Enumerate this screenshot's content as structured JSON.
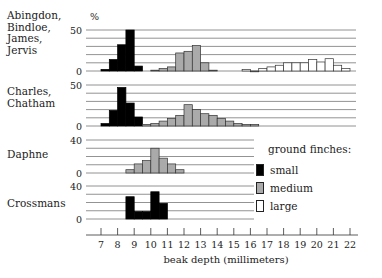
{
  "chart_data": {
    "type": "bar",
    "subtype": "stacked-panel-histograms",
    "xlabel": "beak depth (millimeters)",
    "x_ticks": [
      7,
      8,
      9,
      10,
      11,
      12,
      13,
      14,
      15,
      16,
      17,
      18,
      19,
      20,
      21,
      22
    ],
    "y_unit": "%",
    "bin_width_mm": 0.5,
    "legend": {
      "title": "ground finches:",
      "entries": [
        {
          "name": "small",
          "color": "#000000"
        },
        {
          "name": "medium",
          "color": "#aaaaaa"
        },
        {
          "name": "large",
          "color": "#ffffff"
        }
      ]
    },
    "panels": [
      {
        "name": "Abingdon, Bindloe, James, Jervis",
        "label_lines": [
          "Abingdon,",
          "Bindloe,",
          "James,",
          "Jervis"
        ],
        "y_ticks": [
          0,
          50
        ],
        "ylim": [
          0,
          50
        ],
        "grid_step": 10,
        "series": [
          {
            "name": "small",
            "bins_start": [
              7.0,
              7.5,
              8.0,
              8.5,
              9.0
            ],
            "values": [
              2,
              14,
              32,
              50,
              6
            ]
          },
          {
            "name": "medium",
            "bins_start": [
              10.0,
              10.5,
              11.0,
              11.5,
              12.0,
              12.5,
              13.0,
              13.5
            ],
            "values": [
              1,
              3,
              5,
              22,
              24,
              31,
              10,
              1
            ]
          },
          {
            "name": "large",
            "bins_start": [
              15.5,
              16.0,
              16.5,
              17.0,
              17.5,
              18.0,
              18.5,
              19.0,
              19.5,
              20.0,
              20.5,
              21.0,
              21.5
            ],
            "values": [
              2,
              0,
              3,
              5,
              7,
              10,
              10,
              10,
              14,
              11,
              15,
              7,
              3
            ]
          }
        ]
      },
      {
        "name": "Charles, Chatham",
        "label_lines": [
          "Charles,",
          "Chatham"
        ],
        "y_ticks": [
          0,
          50
        ],
        "ylim": [
          0,
          50
        ],
        "grid_step": 10,
        "series": [
          {
            "name": "small",
            "bins_start": [
              7.0,
              7.5,
              8.0,
              8.5,
              9.0
            ],
            "values": [
              3,
              19,
              47,
              28,
              11
            ]
          },
          {
            "name": "medium",
            "bins_start": [
              9.5,
              10.0,
              10.5,
              11.0,
              11.5,
              12.0,
              12.5,
              13.0,
              13.5,
              14.0,
              14.5,
              15.0,
              15.5,
              16.0
            ],
            "values": [
              2,
              3,
              6,
              9,
              13,
              26,
              20,
              15,
              13,
              9,
              6,
              3,
              2,
              2
            ]
          }
        ]
      },
      {
        "name": "Daphne",
        "label_lines": [
          "Daphne"
        ],
        "y_ticks": [
          0,
          40
        ],
        "ylim": [
          0,
          40
        ],
        "grid_step": 10,
        "series": [
          {
            "name": "medium",
            "bins_start": [
              8.5,
              9.0,
              9.5,
              10.0,
              10.5,
              11.0
            ],
            "values": [
              4,
              11,
              15,
              30,
              18,
              11
            ]
          },
          {
            "name": "medium-tail",
            "bins_start": [
              11.5
            ],
            "values": [
              4
            ]
          }
        ]
      },
      {
        "name": "Crossmans",
        "label_lines": [
          "Crossmans"
        ],
        "y_ticks": [
          0,
          40
        ],
        "ylim": [
          0,
          40
        ],
        "grid_step": 10,
        "series": [
          {
            "name": "small",
            "bins_start": [
              8.5,
              9.0,
              9.5,
              10.0,
              10.5
            ],
            "values": [
              27,
              9,
              9,
              33,
              19
            ]
          }
        ]
      }
    ]
  },
  "legend": {
    "title": "ground finches:",
    "small": "small",
    "medium": "medium",
    "large": "large"
  },
  "axis": {
    "xlabel": "beak depth (millimeters)",
    "unit_symbol": "%"
  },
  "colors": {
    "small": "#000000",
    "medium": "#aaaaaa",
    "large": "#ffffff",
    "stroke": "#222222",
    "grid": "#777777"
  }
}
